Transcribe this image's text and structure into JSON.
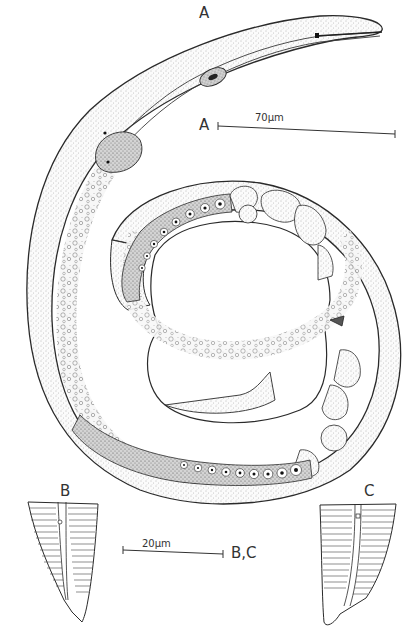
{
  "figure": {
    "panels": [
      {
        "id": "A",
        "label": "A",
        "content": "Entire female body, coiled, anterior end upper right"
      },
      {
        "id": "B",
        "label": "B",
        "content": "Tail, lateral view"
      },
      {
        "id": "C",
        "label": "C",
        "content": "Tail, lateral view (other side)"
      }
    ],
    "scale_bars": [
      {
        "id": "scale-a",
        "text": "70µm",
        "applies_to": "A"
      },
      {
        "id": "scale-bc",
        "text": "20µm",
        "applies_to": "B,C"
      }
    ]
  },
  "labels": {
    "a_top": "A",
    "a_scale": "A",
    "b": "B",
    "c": "C",
    "bc_scale": "B,C"
  },
  "scale_text": {
    "a": "70µm",
    "bc": "20µm"
  },
  "colors": {
    "ink": "#2a2a2a",
    "stipple": "#8a8a8a",
    "background": "#ffffff"
  }
}
